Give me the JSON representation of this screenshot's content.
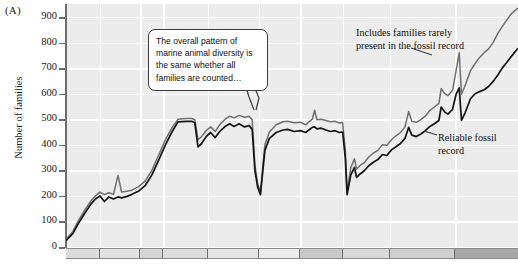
{
  "panel": {
    "label": "(A)"
  },
  "axis": {
    "y_title": "Number of families",
    "y_ticks": [
      "900",
      "800",
      "700",
      "600",
      "500",
      "400",
      "300",
      "200",
      "100",
      "0"
    ]
  },
  "callout": {
    "text": "The overall pattern of marine animal diversity is the same whether all families are counted…"
  },
  "annotations": {
    "top": "Includes families rarely present in the fossil record",
    "bottom": "Reliable fossil record"
  },
  "colors": {
    "plot_background": "#ececed",
    "gridline": "#ffffff",
    "axis": "#6d6d6d",
    "series_all_families": "#6f6f73",
    "series_reliable": "#141414",
    "callout_border": "#3a3a3a",
    "text": "#1a1a1a"
  },
  "band": {
    "segments": [
      {
        "width": 34,
        "shade": "#dcdcdc"
      },
      {
        "width": 40,
        "shade": "#e2e2e2"
      },
      {
        "width": 23,
        "shade": "#d6d6d6"
      },
      {
        "width": 45,
        "shade": "#dddddd"
      },
      {
        "width": 51,
        "shade": "#e6e6e6"
      },
      {
        "width": 41,
        "shade": "#ededed"
      },
      {
        "width": 43,
        "shade": "#c9c9c9"
      },
      {
        "width": 47,
        "shade": "#d9d9d9"
      },
      {
        "width": 65,
        "shade": "#cfcfcf"
      },
      {
        "width": 63,
        "shade": "#a8a8a8"
      }
    ]
  },
  "chart_data": {
    "type": "line",
    "title": "",
    "xlabel": "",
    "ylabel": "Number of families",
    "ylim": [
      0,
      950
    ],
    "xlim": [
      0,
      100
    ],
    "grid": true,
    "legend": "inline-annotations",
    "y_ticks": [
      0,
      100,
      200,
      300,
      400,
      500,
      600,
      700,
      800,
      900
    ],
    "x_gridlines": [
      7.5,
      16.4,
      21.5,
      31.4,
      42.7,
      51.8,
      61.3,
      71.7,
      86.1
    ],
    "series": [
      {
        "name": "Includes families rarely present in the fossil record",
        "color": "#6f6f73",
        "points": [
          [
            0,
            30
          ],
          [
            1.5,
            60
          ],
          [
            2.5,
            95
          ],
          [
            4,
            140
          ],
          [
            5.5,
            180
          ],
          [
            6.5,
            200
          ],
          [
            7.5,
            215
          ],
          [
            8.5,
            205
          ],
          [
            9.5,
            212
          ],
          [
            10.5,
            206
          ],
          [
            11.5,
            280
          ],
          [
            12.3,
            215
          ],
          [
            13.5,
            218
          ],
          [
            14.5,
            222
          ],
          [
            16,
            235
          ],
          [
            17.5,
            258
          ],
          [
            19,
            300
          ],
          [
            20.5,
            360
          ],
          [
            22,
            420
          ],
          [
            23.5,
            468
          ],
          [
            24.8,
            500
          ],
          [
            26.5,
            503
          ],
          [
            27.8,
            503
          ],
          [
            28.5,
            498
          ],
          [
            29.2,
            420
          ],
          [
            30,
            432
          ],
          [
            31,
            455
          ],
          [
            32,
            470
          ],
          [
            33,
            452
          ],
          [
            34,
            478
          ],
          [
            35.2,
            500
          ],
          [
            36.2,
            512
          ],
          [
            37.2,
            505
          ],
          [
            38.3,
            515
          ],
          [
            39.5,
            508
          ],
          [
            40.5,
            512
          ],
          [
            41.2,
            498
          ],
          [
            41.8,
            320
          ],
          [
            42.4,
            248
          ],
          [
            43,
            215
          ],
          [
            44,
            400
          ],
          [
            45,
            450
          ],
          [
            46.5,
            478
          ],
          [
            48,
            490
          ],
          [
            49,
            492
          ],
          [
            50.5,
            486
          ],
          [
            52,
            488
          ],
          [
            53,
            478
          ],
          [
            54.5,
            500
          ],
          [
            55,
            535
          ],
          [
            55.5,
            498
          ],
          [
            56.5,
            500
          ],
          [
            57.5,
            495
          ],
          [
            58.5,
            490
          ],
          [
            59.5,
            492
          ],
          [
            60.5,
            485
          ],
          [
            61.2,
            487
          ],
          [
            61.8,
            380
          ],
          [
            62.2,
            215
          ],
          [
            63,
            310
          ],
          [
            63.8,
            345
          ],
          [
            64.3,
            305
          ],
          [
            65,
            318
          ],
          [
            66,
            330
          ],
          [
            67,
            352
          ],
          [
            68,
            368
          ],
          [
            69,
            378
          ],
          [
            70,
            400
          ],
          [
            71,
            398
          ],
          [
            72,
            420
          ],
          [
            73,
            435
          ],
          [
            74,
            448
          ],
          [
            75,
            470
          ],
          [
            75.8,
            530
          ],
          [
            76.5,
            492
          ],
          [
            77.5,
            488
          ],
          [
            78.5,
            498
          ],
          [
            79.5,
            512
          ],
          [
            80.5,
            535
          ],
          [
            81.5,
            548
          ],
          [
            82.5,
            562
          ],
          [
            83,
            620
          ],
          [
            83.8,
            600
          ],
          [
            84.5,
            592
          ],
          [
            85.5,
            612
          ],
          [
            86.3,
            690
          ],
          [
            87,
            760
          ],
          [
            87.5,
            598
          ],
          [
            88.3,
            632
          ],
          [
            89.5,
            690
          ],
          [
            90.5,
            718
          ],
          [
            91.5,
            742
          ],
          [
            92.5,
            760
          ],
          [
            93.5,
            775
          ],
          [
            94.5,
            800
          ],
          [
            95.5,
            835
          ],
          [
            96.5,
            862
          ],
          [
            97.5,
            888
          ],
          [
            98.5,
            912
          ],
          [
            100,
            935
          ]
        ]
      },
      {
        "name": "Reliable fossil record",
        "color": "#141414",
        "points": [
          [
            0,
            25
          ],
          [
            1.5,
            52
          ],
          [
            2.5,
            85
          ],
          [
            4,
            128
          ],
          [
            5.5,
            168
          ],
          [
            6.5,
            188
          ],
          [
            7.5,
            200
          ],
          [
            8.5,
            178
          ],
          [
            9.5,
            196
          ],
          [
            10.5,
            188
          ],
          [
            11.5,
            196
          ],
          [
            12.3,
            192
          ],
          [
            13.5,
            198
          ],
          [
            14.5,
            205
          ],
          [
            16,
            218
          ],
          [
            17.5,
            240
          ],
          [
            19,
            282
          ],
          [
            20.5,
            340
          ],
          [
            22,
            400
          ],
          [
            23.5,
            452
          ],
          [
            24.8,
            490
          ],
          [
            26.5,
            492
          ],
          [
            27.8,
            492
          ],
          [
            28.5,
            486
          ],
          [
            29.2,
            392
          ],
          [
            30,
            405
          ],
          [
            31,
            432
          ],
          [
            32,
            448
          ],
          [
            33,
            428
          ],
          [
            34,
            452
          ],
          [
            35.2,
            472
          ],
          [
            36.2,
            482
          ],
          [
            37.2,
            472
          ],
          [
            38.3,
            482
          ],
          [
            39.5,
            470
          ],
          [
            40.5,
            475
          ],
          [
            41.2,
            460
          ],
          [
            41.8,
            300
          ],
          [
            42.4,
            235
          ],
          [
            43,
            205
          ],
          [
            44,
            378
          ],
          [
            45,
            425
          ],
          [
            46.5,
            448
          ],
          [
            48,
            458
          ],
          [
            49,
            460
          ],
          [
            50.5,
            452
          ],
          [
            52,
            455
          ],
          [
            53,
            448
          ],
          [
            54.5,
            468
          ],
          [
            55,
            470
          ],
          [
            55.5,
            462
          ],
          [
            56.5,
            465
          ],
          [
            57.5,
            458
          ],
          [
            58.5,
            452
          ],
          [
            59.5,
            455
          ],
          [
            60.5,
            448
          ],
          [
            61.2,
            450
          ],
          [
            61.8,
            350
          ],
          [
            62.2,
            205
          ],
          [
            63,
            282
          ],
          [
            63.8,
            312
          ],
          [
            64.3,
            272
          ],
          [
            65,
            285
          ],
          [
            66,
            298
          ],
          [
            67,
            318
          ],
          [
            68,
            332
          ],
          [
            69,
            342
          ],
          [
            70,
            362
          ],
          [
            71,
            358
          ],
          [
            72,
            380
          ],
          [
            73,
            392
          ],
          [
            74,
            405
          ],
          [
            75,
            425
          ],
          [
            75.8,
            468
          ],
          [
            76.5,
            438
          ],
          [
            77.5,
            432
          ],
          [
            78.5,
            442
          ],
          [
            79.5,
            455
          ],
          [
            80.5,
            472
          ],
          [
            81.5,
            482
          ],
          [
            82.5,
            495
          ],
          [
            83,
            548
          ],
          [
            83.8,
            528
          ],
          [
            84.5,
            520
          ],
          [
            85.5,
            538
          ],
          [
            86.3,
            598
          ],
          [
            87,
            622
          ],
          [
            87.5,
            495
          ],
          [
            88.3,
            525
          ],
          [
            89.5,
            580
          ],
          [
            90.5,
            600
          ],
          [
            91.5,
            608
          ],
          [
            92.5,
            615
          ],
          [
            93.5,
            628
          ],
          [
            94.5,
            648
          ],
          [
            95.5,
            672
          ],
          [
            96.5,
            700
          ],
          [
            97.5,
            722
          ],
          [
            98.5,
            745
          ],
          [
            100,
            778
          ]
        ]
      }
    ]
  }
}
